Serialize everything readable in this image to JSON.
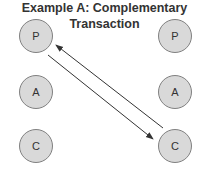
{
  "title": "Example A: Complementary Transaction",
  "nodes": [
    {
      "id": "left-P",
      "label": "P",
      "cx": 36,
      "cy": 36
    },
    {
      "id": "left-A",
      "label": "A",
      "cx": 36,
      "cy": 92
    },
    {
      "id": "left-C",
      "label": "C",
      "cx": 36,
      "cy": 146
    },
    {
      "id": "right-P",
      "label": "P",
      "cx": 175,
      "cy": 36
    },
    {
      "id": "right-A",
      "label": "A",
      "cx": 175,
      "cy": 92
    },
    {
      "id": "right-C",
      "label": "C",
      "cx": 175,
      "cy": 146
    }
  ],
  "arrows": [
    {
      "from": "left-P",
      "to": "right-C"
    },
    {
      "from": "right-C",
      "to": "left-P"
    }
  ],
  "colors": {
    "node_fill": "#d9d9d9",
    "node_stroke": "#808080",
    "arrow": "#333333",
    "text": "#333333"
  }
}
